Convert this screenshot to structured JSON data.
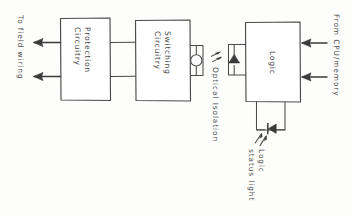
{
  "diagram": {
    "orientation": "rotated-90",
    "ink_color": "#4a4a4a",
    "background_color": "#fdfdfc",
    "blocks": [
      {
        "id": "protection",
        "label": "Protection\nCircuitry",
        "label_line1": "Protection",
        "label_line2": "Circuitry"
      },
      {
        "id": "switching",
        "label": "Switching\nCircuitry",
        "label_line1": "Switching",
        "label_line2": "Circuitry"
      },
      {
        "id": "logic",
        "label": "Logic",
        "label_line1": "Logic",
        "label_line2": ""
      }
    ],
    "annotations": [
      {
        "id": "field-wiring",
        "text": "To field wiring"
      },
      {
        "id": "optical-isolation",
        "text": "Optical Isolation"
      },
      {
        "id": "cpu-memory",
        "text": "From CPU/memory"
      },
      {
        "id": "logic-status-light-line1",
        "text": "Logic"
      },
      {
        "id": "logic-status-light-line2",
        "text": "status light"
      }
    ],
    "symbols": [
      {
        "id": "photodetector",
        "type": "circle"
      },
      {
        "id": "isolation-led",
        "type": "led-triangle"
      },
      {
        "id": "status-led",
        "type": "led-triangle"
      },
      {
        "id": "light-rays-isolation",
        "type": "emission-rays"
      },
      {
        "id": "light-rays-status",
        "type": "emission-rays"
      }
    ],
    "arrows": [
      {
        "id": "field-output-top",
        "direction": "left"
      },
      {
        "id": "field-output-bottom",
        "direction": "left"
      },
      {
        "id": "cpu-input-top",
        "direction": "left"
      },
      {
        "id": "cpu-input-bottom",
        "direction": "left"
      }
    ]
  }
}
